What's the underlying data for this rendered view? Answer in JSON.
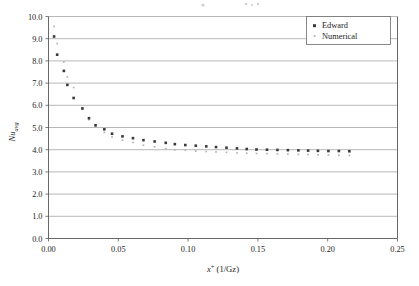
{
  "chart_data": {
    "type": "scatter",
    "title": "",
    "subtitle": "",
    "xlabel": "x+ (1/Gz)",
    "xlabel_base": "x",
    "xlabel_sup": "+",
    "xlabel_rest": " (1/Gz)",
    "ylabel": "Nuavg",
    "ylabel_base": "Nu",
    "ylabel_sub": "avg",
    "xlim": [
      0.0,
      0.25
    ],
    "ylim": [
      0.0,
      10.0
    ],
    "xticks": [
      0.0,
      0.05,
      0.1,
      0.15,
      0.2,
      0.25
    ],
    "xtick_labels": [
      "0.00",
      "0.05",
      "0.10",
      "0.15",
      "0.20",
      "0.25"
    ],
    "yticks": [
      0.0,
      1.0,
      2.0,
      3.0,
      4.0,
      5.0,
      6.0,
      7.0,
      8.0,
      9.0,
      10.0
    ],
    "ytick_labels": [
      "0.0",
      "1.0",
      "2.0",
      "3.0",
      "4.0",
      "5.0",
      "6.0",
      "7.0",
      "8.0",
      "9.0",
      "10.0"
    ],
    "grid": "horizontal",
    "legend_position": "top-right",
    "series": [
      {
        "name": "Edward",
        "marker": "square",
        "marker_size": 2.6,
        "color": "#3a3a3a",
        "points": [
          [
            0.004,
            9.1
          ],
          [
            0.0062,
            8.28
          ],
          [
            0.011,
            7.55
          ],
          [
            0.0135,
            6.92
          ],
          [
            0.018,
            6.33
          ],
          [
            0.0243,
            5.86
          ],
          [
            0.029,
            5.42
          ],
          [
            0.0337,
            5.1
          ],
          [
            0.04,
            4.92
          ],
          [
            0.0455,
            4.72
          ],
          [
            0.053,
            4.6
          ],
          [
            0.0605,
            4.52
          ],
          [
            0.068,
            4.43
          ],
          [
            0.076,
            4.37
          ],
          [
            0.084,
            4.31
          ],
          [
            0.0905,
            4.25
          ],
          [
            0.098,
            4.21
          ],
          [
            0.1055,
            4.18
          ],
          [
            0.113,
            4.15
          ],
          [
            0.12,
            4.12
          ],
          [
            0.1275,
            4.09
          ],
          [
            0.135,
            4.06
          ],
          [
            0.142,
            4.03
          ],
          [
            0.149,
            4.01
          ],
          [
            0.1565,
            4.0
          ],
          [
            0.164,
            3.99
          ],
          [
            0.1715,
            3.98
          ],
          [
            0.179,
            3.97
          ],
          [
            0.186,
            3.96
          ],
          [
            0.193,
            3.95
          ],
          [
            0.2005,
            3.94
          ],
          [
            0.208,
            3.94
          ],
          [
            0.2155,
            3.93
          ]
        ]
      },
      {
        "name": "Numerical",
        "marker": "square",
        "marker_size": 1.7,
        "color": "#b4b4b4",
        "points": [
          [
            0.004,
            9.55
          ],
          [
            0.0062,
            8.78
          ],
          [
            0.011,
            7.95
          ],
          [
            0.0135,
            7.28
          ],
          [
            0.018,
            6.8
          ],
          [
            0.0243,
            5.82
          ],
          [
            0.029,
            5.35
          ],
          [
            0.0337,
            5.02
          ],
          [
            0.04,
            4.78
          ],
          [
            0.0455,
            4.57
          ],
          [
            0.053,
            4.43
          ],
          [
            0.0605,
            4.33
          ],
          [
            0.068,
            4.2
          ],
          [
            0.076,
            4.13
          ],
          [
            0.084,
            4.05
          ],
          [
            0.0905,
            4.0
          ],
          [
            0.098,
            3.98
          ],
          [
            0.1055,
            3.94
          ],
          [
            0.113,
            3.92
          ],
          [
            0.12,
            3.9
          ],
          [
            0.1275,
            3.88
          ],
          [
            0.135,
            3.86
          ],
          [
            0.142,
            3.84
          ],
          [
            0.149,
            3.83
          ],
          [
            0.1565,
            3.82
          ],
          [
            0.164,
            3.81
          ],
          [
            0.1715,
            3.8
          ],
          [
            0.179,
            3.79
          ],
          [
            0.186,
            3.78
          ],
          [
            0.193,
            3.77
          ],
          [
            0.2005,
            3.76
          ],
          [
            0.208,
            3.75
          ],
          [
            0.2155,
            3.74
          ]
        ]
      }
    ],
    "annotations": []
  },
  "legend": {
    "entries": [
      {
        "label": "Edward"
      },
      {
        "label": "Numerical"
      }
    ]
  },
  "colors": {
    "series_edward": "#3a3a3a",
    "series_numerical": "#b4b4b4",
    "gridline": "#9a9a9a",
    "axis": "#575757",
    "background": "#ffffff",
    "text": "#1d1d1d"
  }
}
